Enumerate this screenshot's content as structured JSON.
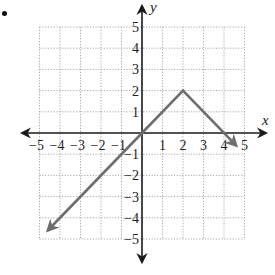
{
  "problem": {
    "bullet": "•"
  },
  "chart_data": {
    "type": "line",
    "title": "",
    "xlabel": "x",
    "ylabel": "y",
    "xlim": [
      -5,
      5
    ],
    "ylim": [
      -5,
      5
    ],
    "grid": true,
    "grid_style": "dotted",
    "x_ticks": [
      "−5",
      "−4",
      "−3",
      "−2",
      "−1",
      "1",
      "2",
      "3",
      "4",
      "5"
    ],
    "y_ticks": [
      "5",
      "4",
      "3",
      "2",
      "1",
      "−1",
      "−2",
      "−3",
      "−4",
      "−5"
    ],
    "series": [
      {
        "name": "piecewise linear (tent)",
        "color": "#6e6e6e",
        "points": [
          [
            -4.6,
            -4.6
          ],
          [
            0,
            0
          ],
          [
            2,
            2
          ],
          [
            4.6,
            -0.6
          ]
        ],
        "arrow_start": true,
        "arrow_end": true
      }
    ],
    "colors": {
      "axis": "#1a1a1a",
      "grid": "#a8a8a8",
      "line": "#6e6e6e"
    }
  }
}
